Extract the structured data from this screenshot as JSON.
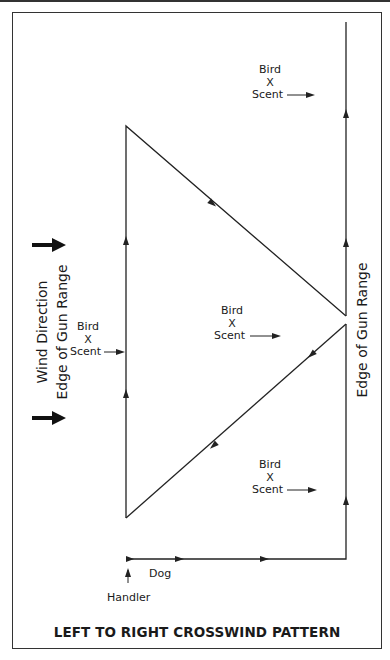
{
  "diagram": {
    "title": "LEFT TO RIGHT CROSSWIND PATTERN",
    "left_labels": {
      "wind_direction": "Wind Direction",
      "edge_of_gun_range": "Edge of Gun Range"
    },
    "right_label": "Edge of Gun Range",
    "scent_markers": [
      {
        "bird": "Bird",
        "x": "X",
        "scent": "Scent"
      },
      {
        "bird": "Bird",
        "x": "X",
        "scent": "Scent"
      },
      {
        "bird": "Bird",
        "x": "X",
        "scent": "Scent"
      },
      {
        "bird": "Bird",
        "x": "X",
        "scent": "Scent"
      }
    ],
    "dog_label": "Dog",
    "handler_label": "Handler",
    "colors": {
      "line": "#222222",
      "frame": "#333333",
      "background": "#ffffff"
    }
  }
}
